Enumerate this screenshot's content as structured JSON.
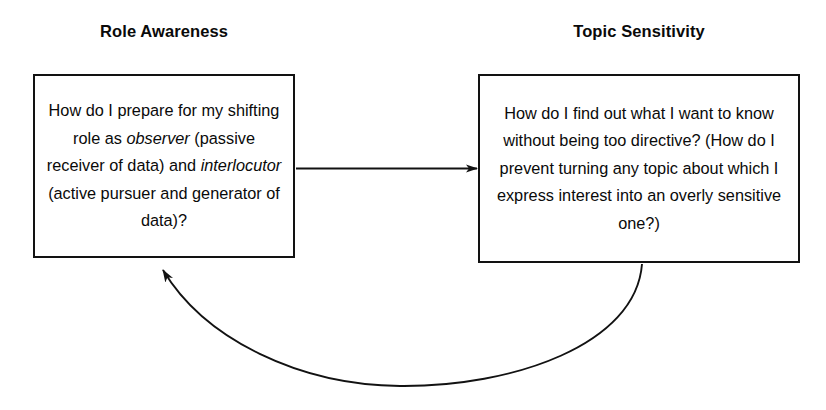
{
  "diagram": {
    "background_color": "#ffffff",
    "stroke_color": "#121212",
    "text_color": "#0a0a0a",
    "nodes": [
      {
        "id": "role_awareness",
        "heading": "Role Awareness",
        "body_plain": "How do I prepare for my shifting role as observer (passive receiver of data) and interlocutor (active pursuer and generator of data)?",
        "body_segments": [
          {
            "text": "How do I prepare for my shifting role as ",
            "italic": false
          },
          {
            "text": "observer",
            "italic": true
          },
          {
            "text": " (passive receiver of data) and ",
            "italic": false
          },
          {
            "text": "interlocutor",
            "italic": true
          },
          {
            "text": " (active pursuer and generator of data)?",
            "italic": false
          }
        ]
      },
      {
        "id": "topic_sensitivity",
        "heading": "Topic Sensitivity",
        "body_plain": "How do I find out what I want to know without being too directive? (How do I prevent turning any topic about which I express interest into an overly sensitive one?)",
        "body_segments": [
          {
            "text": "How do I find out what I want to know without being too directive? (How do I prevent turning any topic about which I express interest into an overly sensitive one?)",
            "italic": false
          }
        ]
      }
    ],
    "edges": [
      {
        "id": "role_to_topic",
        "style": "straight",
        "from": "role_awareness",
        "to": "topic_sensitivity",
        "direction": "left-to-right"
      },
      {
        "id": "topic_to_role",
        "style": "curved",
        "from": "topic_sensitivity",
        "to": "role_awareness",
        "direction": "right-to-left-below"
      }
    ]
  }
}
